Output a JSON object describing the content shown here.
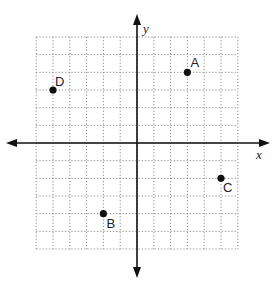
{
  "diagram": {
    "type": "coordinate-plane",
    "axes": {
      "x_label": "x",
      "y_label": "y"
    },
    "grid": {
      "x_min": -6,
      "x_max": 6,
      "y_min": -6,
      "y_max": 6,
      "step": 1,
      "style": "dotted"
    },
    "points": [
      {
        "label": "A",
        "x": 3,
        "y": 4
      },
      {
        "label": "B",
        "x": -2,
        "y": -4
      },
      {
        "label": "C",
        "x": 5,
        "y": -2
      },
      {
        "label": "D",
        "x": -5,
        "y": 3
      }
    ]
  },
  "chart_data": {
    "type": "scatter",
    "title": "",
    "xlabel": "x",
    "ylabel": "y",
    "xlim": [
      -6,
      6
    ],
    "ylim": [
      -6,
      6
    ],
    "grid": true,
    "series": [
      {
        "name": "points",
        "labels": [
          "A",
          "B",
          "C",
          "D"
        ],
        "x": [
          3,
          -2,
          5,
          -5
        ],
        "y": [
          4,
          -4,
          -2,
          3
        ]
      }
    ]
  }
}
